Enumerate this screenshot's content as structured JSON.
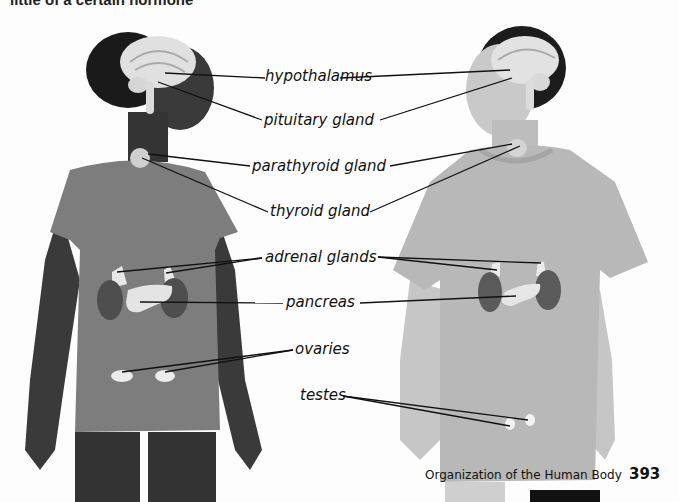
{
  "page": {
    "top_text_fragment": "little of a certain hormone",
    "footer": {
      "section_title": "Organization of the Human Body",
      "page_number": "393"
    }
  },
  "figure": {
    "subjects": [
      {
        "name": "girl",
        "side": "left",
        "shirt_color": "#7d7d7d",
        "skin_color": "#3a3a3a"
      },
      {
        "name": "boy",
        "side": "right",
        "shirt_color": "#b8b8b8",
        "skin_color": "#c9c9c9"
      }
    ],
    "labels": [
      {
        "id": "hypothalamus",
        "text": "hypothalamus",
        "points_to": [
          "girl",
          "boy"
        ]
      },
      {
        "id": "pituitary",
        "text": "pituitary gland",
        "points_to": [
          "girl",
          "boy"
        ]
      },
      {
        "id": "parathyroid",
        "text": "parathyroid gland",
        "points_to": [
          "girl",
          "boy"
        ]
      },
      {
        "id": "thyroid",
        "text": "thyroid gland",
        "points_to": [
          "girl",
          "boy"
        ]
      },
      {
        "id": "adrenal",
        "text": "adrenal glands",
        "points_to": [
          "girl",
          "boy"
        ]
      },
      {
        "id": "pancreas",
        "text": "pancreas",
        "points_to": [
          "girl",
          "boy"
        ]
      },
      {
        "id": "ovaries",
        "text": "ovaries",
        "points_to": [
          "girl"
        ]
      },
      {
        "id": "testes",
        "text": "testes",
        "points_to": [
          "boy"
        ]
      }
    ]
  }
}
